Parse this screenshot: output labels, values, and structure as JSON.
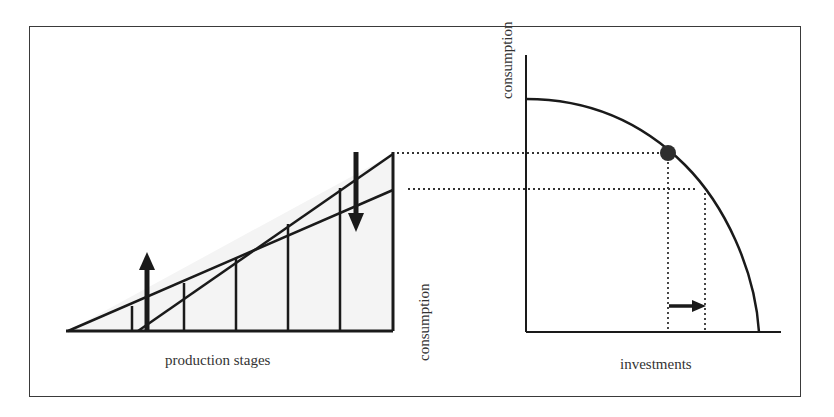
{
  "diagram": {
    "left_panel": {
      "x_label": "production stages",
      "y_label": "consumption",
      "stages": 6,
      "arrows": [
        {
          "direction": "up",
          "meaning": "early stages expand"
        },
        {
          "direction": "down",
          "meaning": "late stages contract"
        }
      ]
    },
    "right_panel": {
      "x_label": "investments",
      "y_label": "consumption",
      "curve": "production possibility frontier",
      "point": "current allocation",
      "arrow": {
        "direction": "right",
        "meaning": "shift toward investment"
      }
    },
    "colors": {
      "line": "#1a1a1a",
      "dotted": "#333333",
      "point": "#2e2e2e",
      "fill": "#f3f3f3",
      "frame": "#3a3a3a"
    }
  }
}
